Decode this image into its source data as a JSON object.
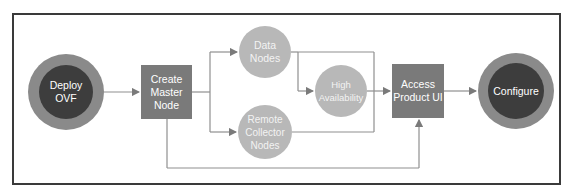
{
  "diagram": {
    "nodes": {
      "deploy_ovf": "Deploy OVF",
      "create_master": "Create Master Node",
      "data_nodes": "Data Nodes",
      "high_availability": "High Availability",
      "remote_collector": "Remote Collector Nodes",
      "access_ui": "Access Product UI",
      "configure": "Configure"
    },
    "edges": [
      [
        "Deploy OVF",
        "Create Master Node"
      ],
      [
        "Create Master Node",
        "Data Nodes"
      ],
      [
        "Create Master Node",
        "Remote Collector Nodes"
      ],
      [
        "Create Master Node",
        "Access Product UI"
      ],
      [
        "Data Nodes",
        "High Availability"
      ],
      [
        "Data Nodes",
        "Access Product UI"
      ],
      [
        "Remote Collector Nodes",
        "Access Product UI"
      ],
      [
        "High Availability",
        "Access Product UI"
      ],
      [
        "Access Product UI",
        "Configure"
      ]
    ],
    "colors": {
      "terminal_outer": "#8a8a8a",
      "terminal_inner": "#3d3d3d",
      "process_box": "#7a7a7a",
      "optional_circle": "#b8b8b8",
      "connector": "#8a8a8a",
      "frame": "#3a3a3a"
    }
  }
}
